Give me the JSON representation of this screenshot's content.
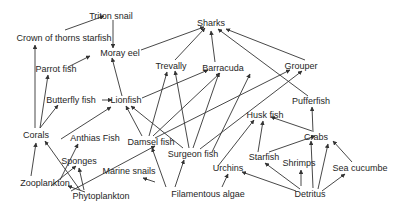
{
  "colors": {
    "text": "#262626",
    "arrow": "#333333",
    "background": "#ffffff"
  },
  "nodes": [
    {
      "id": "triton",
      "label": "Triton snail",
      "x": 111,
      "y": 16
    },
    {
      "id": "crown",
      "label": "Crown of thorns starfish",
      "x": 64,
      "y": 38
    },
    {
      "id": "sharks",
      "label": "Sharks",
      "x": 211,
      "y": 23
    },
    {
      "id": "moray",
      "label": "Moray eel",
      "x": 120,
      "y": 53
    },
    {
      "id": "parrot",
      "label": "Parrot fish",
      "x": 56,
      "y": 69
    },
    {
      "id": "trevally",
      "label": "Trevally",
      "x": 171,
      "y": 66
    },
    {
      "id": "barracuda",
      "label": "Barracuda",
      "x": 223,
      "y": 68
    },
    {
      "id": "grouper",
      "label": "Grouper",
      "x": 301,
      "y": 66
    },
    {
      "id": "butterfly",
      "label": "Butterfly fish",
      "x": 71,
      "y": 100
    },
    {
      "id": "lionfish",
      "label": "Lionfish",
      "x": 126,
      "y": 100
    },
    {
      "id": "pufferfish",
      "label": "Pufferfish",
      "x": 311,
      "y": 101
    },
    {
      "id": "corals",
      "label": "Corals",
      "x": 36,
      "y": 135
    },
    {
      "id": "anthias",
      "label": "Anthias Fish",
      "x": 95,
      "y": 138
    },
    {
      "id": "damsel",
      "label": "Damsel fish",
      "x": 151,
      "y": 142
    },
    {
      "id": "huskfish",
      "label": "Husk fish",
      "x": 265,
      "y": 115
    },
    {
      "id": "crabs",
      "label": "Crabs",
      "x": 316,
      "y": 137
    },
    {
      "id": "surgeon",
      "label": "Surgeon fish",
      "x": 193,
      "y": 154
    },
    {
      "id": "starfish",
      "label": "Starfish",
      "x": 264,
      "y": 157
    },
    {
      "id": "shrimps",
      "label": "Shrimps",
      "x": 299,
      "y": 163
    },
    {
      "id": "seacucumber",
      "label": "Sea cucumbe",
      "x": 360,
      "y": 168
    },
    {
      "id": "sponges",
      "label": "Sponges",
      "x": 79,
      "y": 161
    },
    {
      "id": "marinesnails",
      "label": "Marine snails",
      "x": 129,
      "y": 171
    },
    {
      "id": "urchins",
      "label": "Urchins",
      "x": 228,
      "y": 168
    },
    {
      "id": "zooplankton",
      "label": "Zooplankton",
      "x": 45,
      "y": 183
    },
    {
      "id": "phytoplankton",
      "label": "Phytoplankton",
      "x": 101,
      "y": 196
    },
    {
      "id": "filamentous",
      "label": "Filamentous algae",
      "x": 208,
      "y": 194
    },
    {
      "id": "detritus",
      "label": "Detritus",
      "x": 310,
      "y": 194
    }
  ],
  "edges": [
    [
      65,
      30,
      104,
      16
    ],
    [
      113,
      20,
      113,
      48
    ],
    [
      68,
      67,
      90,
      56
    ],
    [
      141,
      50,
      204,
      27
    ],
    [
      175,
      60,
      205,
      28
    ],
    [
      215,
      62,
      211,
      31
    ],
    [
      305,
      60,
      226,
      29
    ],
    [
      308,
      96,
      218,
      29
    ],
    [
      102,
      100,
      112,
      100
    ],
    [
      122,
      96,
      112,
      58
    ],
    [
      142,
      98,
      208,
      70
    ],
    [
      35,
      128,
      35,
      45
    ],
    [
      40,
      128,
      48,
      75
    ],
    [
      40,
      128,
      58,
      105
    ],
    [
      61,
      139,
      111,
      107
    ],
    [
      142,
      136,
      126,
      106
    ],
    [
      149,
      136,
      167,
      72
    ],
    [
      153,
      136,
      220,
      73
    ],
    [
      155,
      138,
      290,
      70
    ],
    [
      183,
      148,
      131,
      106
    ],
    [
      189,
      148,
      175,
      71
    ],
    [
      193,
      148,
      219,
      73
    ],
    [
      200,
      149,
      302,
      71
    ],
    [
      212,
      152,
      250,
      74
    ],
    [
      218,
      166,
      254,
      120
    ],
    [
      258,
      152,
      263,
      121
    ],
    [
      269,
      152,
      315,
      136
    ],
    [
      312,
      131,
      271,
      117
    ],
    [
      313,
      132,
      312,
      107
    ],
    [
      60,
      180,
      78,
      144
    ],
    [
      31,
      176,
      36,
      143
    ],
    [
      80,
      190,
      45,
      141
    ],
    [
      71,
      191,
      155,
      146
    ],
    [
      51,
      186,
      76,
      166
    ],
    [
      85,
      192,
      68,
      186
    ],
    [
      84,
      190,
      79,
      168
    ],
    [
      166,
      187,
      152,
      148
    ],
    [
      175,
      187,
      184,
      160
    ],
    [
      155,
      182,
      143,
      178
    ],
    [
      222,
      187,
      228,
      174
    ],
    [
      296,
      191,
      242,
      172
    ],
    [
      300,
      189,
      265,
      163
    ],
    [
      301,
      186,
      301,
      170
    ],
    [
      313,
      188,
      311,
      141
    ],
    [
      318,
      189,
      328,
      144
    ],
    [
      322,
      191,
      345,
      174
    ],
    [
      352,
      162,
      333,
      141
    ]
  ]
}
